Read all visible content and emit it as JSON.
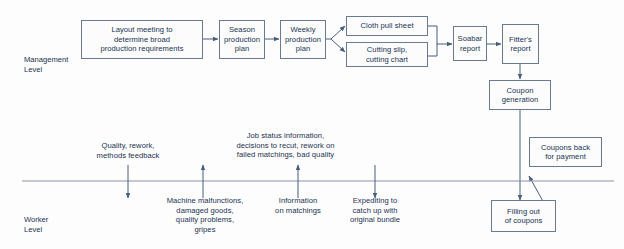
{
  "diagram": {
    "colors": {
      "box_border": "#6b7a93",
      "box_fill": "#fcfcfd",
      "text": "#18324f",
      "connector": "#4a5d78",
      "divider": "#8b94a3",
      "background": "#fdfdfd"
    },
    "lanes": [
      {
        "id": "management",
        "label": "Management\nLevel"
      },
      {
        "id": "worker",
        "label": "Worker\nLevel"
      }
    ],
    "management_nodes": [
      {
        "id": "layout-meeting",
        "label": "Layout meeting to\ndetermine broad\nproduction requirements"
      },
      {
        "id": "season-production-plan",
        "label": "Season\nproduction\nplan"
      },
      {
        "id": "weekly-production-plan",
        "label": "Weekly\nproduction\nplan"
      },
      {
        "id": "cloth-pull-sheet",
        "label": "Cloth pull sheet"
      },
      {
        "id": "cutting-slip-chart",
        "label": "Cutting slip,\ncutting chart"
      },
      {
        "id": "soabar-report",
        "label": "Soabar\nreport"
      },
      {
        "id": "fitters-report",
        "label": "Fitter's\nreport"
      },
      {
        "id": "coupon-generation",
        "label": "Coupon\ngeneration"
      }
    ],
    "worker_nodes": [
      {
        "id": "filling-out-coupons",
        "label": "Filling out\nof coupons"
      },
      {
        "id": "coupons-back-for-payment",
        "label": "Coupons back\nfor payment"
      }
    ],
    "flow_labels": [
      {
        "id": "quality-rework",
        "label": "Quality, rework,\nmethods feedback",
        "direction": "down"
      },
      {
        "id": "machine-malfunctions",
        "label": "Machine malfunctions,\ndamaged goods,\nquality problems,\ngripes",
        "direction": "up"
      },
      {
        "id": "job-status-information",
        "label": "Job status information,\ndecisions to recut, rework on\nfailed matchings, bad quality",
        "direction": "down"
      },
      {
        "id": "information-on-matchings",
        "label": "Information\non matchings",
        "direction": "up"
      },
      {
        "id": "expediting",
        "label": "Expediting to\ncatch up with\noriginal bundle",
        "direction": "down"
      }
    ]
  }
}
